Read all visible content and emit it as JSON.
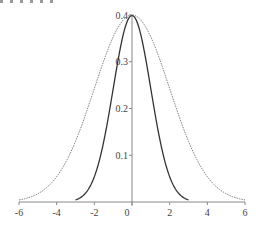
{
  "chart_data": {
    "type": "line",
    "title": "",
    "xlabel": "",
    "ylabel": "",
    "xlim": [
      -6,
      6
    ],
    "ylim": [
      0,
      0.4
    ],
    "grid": false,
    "legend": null,
    "x_ticks": [
      -6,
      -4,
      -2,
      0,
      2,
      4,
      6
    ],
    "x_tick_labels": [
      "-6",
      "-4",
      "-2",
      "0",
      "2",
      "4",
      "6"
    ],
    "y_ticks": [
      0.1,
      0.2,
      0.3,
      0.4
    ],
    "y_tick_labels": [
      "0.1",
      "0.2",
      "0.3",
      "0.4"
    ],
    "series": [
      {
        "name": "narrow density (solid)",
        "style": "solid",
        "color": "#333333",
        "x": [
          -3,
          -2.5,
          -2,
          -1.5,
          -1,
          -0.5,
          0,
          0.5,
          1,
          1.5,
          2,
          2.5,
          3
        ],
        "values": [
          0.004,
          0.018,
          0.054,
          0.13,
          0.242,
          0.352,
          0.399,
          0.352,
          0.242,
          0.13,
          0.054,
          0.018,
          0.004
        ]
      },
      {
        "name": "wide density (dotted)",
        "style": "dotted",
        "color": "#777777",
        "x": [
          -6,
          -5,
          -4,
          -3,
          -2,
          -1,
          0,
          1,
          2,
          3,
          4,
          5,
          6
        ],
        "values": [
          0.004,
          0.018,
          0.054,
          0.13,
          0.243,
          0.353,
          0.4,
          0.353,
          0.243,
          0.13,
          0.054,
          0.018,
          0.004
        ]
      }
    ]
  },
  "axes": {
    "origin_label": "0"
  }
}
